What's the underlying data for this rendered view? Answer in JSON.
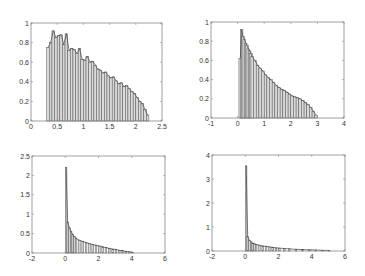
{
  "chart_data": [
    {
      "id": "top-left",
      "type": "bar",
      "title": "",
      "xlabel": "",
      "ylabel": "",
      "xlim": [
        0,
        2.5
      ],
      "ylim": [
        0,
        1
      ],
      "xticks": [
        0,
        0.5,
        1,
        1.5,
        2,
        2.5
      ],
      "xtick_labels": [
        "0",
        "0.5",
        "1",
        "1.5",
        "2",
        "2.5"
      ],
      "yticks": [
        0,
        0.2,
        0.4,
        0.6,
        0.8,
        1
      ],
      "ytick_labels": [
        "0",
        "0.2",
        "0.4",
        "0.6",
        "0.8",
        "1"
      ],
      "grid": false,
      "box": {
        "x0": 31,
        "y0": 23,
        "x1": 162,
        "y1": 121
      },
      "bins_x": [
        0.3,
        0.35,
        0.4,
        0.45,
        0.5,
        0.55,
        0.6,
        0.65,
        0.7,
        0.75,
        0.8,
        0.85,
        0.9,
        0.95,
        1.0,
        1.05,
        1.1,
        1.15,
        1.2,
        1.25,
        1.3,
        1.35,
        1.4,
        1.45,
        1.5,
        1.55,
        1.6,
        1.65,
        1.7,
        1.75,
        1.8,
        1.85,
        1.9,
        1.95,
        2.0,
        2.05,
        2.1,
        2.15,
        2.2
      ],
      "values": [
        0.75,
        0.8,
        0.92,
        0.85,
        0.87,
        0.88,
        0.78,
        0.89,
        0.72,
        0.74,
        0.73,
        0.69,
        0.74,
        0.63,
        0.62,
        0.66,
        0.6,
        0.61,
        0.57,
        0.53,
        0.52,
        0.49,
        0.5,
        0.46,
        0.44,
        0.45,
        0.41,
        0.38,
        0.39,
        0.35,
        0.36,
        0.33,
        0.3,
        0.28,
        0.24,
        0.2,
        0.18,
        0.12,
        0.06
      ],
      "bin_width": 0.05,
      "curve": "density"
    },
    {
      "id": "top-right",
      "type": "bar",
      "title": "",
      "xlabel": "",
      "ylabel": "",
      "xlim": [
        -1,
        4
      ],
      "ylim": [
        0,
        1
      ],
      "xticks": [
        -1,
        0,
        1,
        2,
        3,
        4
      ],
      "xtick_labels": [
        "-1",
        "0",
        "1",
        "2",
        "3",
        "4"
      ],
      "yticks": [
        0,
        0.2,
        0.4,
        0.6,
        0.8,
        1
      ],
      "ytick_labels": [
        "0",
        "0.2",
        "0.4",
        "0.6",
        "0.8",
        "1"
      ],
      "grid": false,
      "box": {
        "x0": 211,
        "y0": 22,
        "x1": 344,
        "y1": 118
      },
      "bins_x": [
        0.05,
        0.1,
        0.15,
        0.2,
        0.25,
        0.3,
        0.35,
        0.4,
        0.45,
        0.5,
        0.6,
        0.7,
        0.8,
        0.9,
        1.0,
        1.1,
        1.2,
        1.3,
        1.4,
        1.5,
        1.6,
        1.7,
        1.8,
        1.9,
        2.0,
        2.1,
        2.2,
        2.3,
        2.4,
        2.5,
        2.6,
        2.7,
        2.8,
        2.9
      ],
      "values": [
        0.62,
        0.92,
        0.85,
        0.82,
        0.78,
        0.76,
        0.72,
        0.7,
        0.67,
        0.64,
        0.6,
        0.55,
        0.52,
        0.49,
        0.45,
        0.42,
        0.4,
        0.37,
        0.34,
        0.32,
        0.3,
        0.29,
        0.27,
        0.25,
        0.23,
        0.22,
        0.21,
        0.2,
        0.18,
        0.16,
        0.14,
        0.11,
        0.07,
        0.03
      ],
      "bin_width": 0.1,
      "curve": "density"
    },
    {
      "id": "bottom-left",
      "type": "bar",
      "title": "",
      "xlabel": "",
      "ylabel": "",
      "xlim": [
        -2,
        6
      ],
      "ylim": [
        0,
        2.5
      ],
      "xticks": [
        -2,
        0,
        2,
        4,
        6
      ],
      "xtick_labels": [
        "-2",
        "0",
        "2",
        "4",
        "6"
      ],
      "yticks": [
        0,
        0.5,
        1,
        1.5,
        2,
        2.5
      ],
      "ytick_labels": [
        "0",
        "0.5",
        "1",
        "1.5",
        "2",
        "2.5"
      ],
      "grid": false,
      "box": {
        "x0": 32,
        "y0": 156,
        "x1": 165,
        "y1": 253
      },
      "bins_x": [
        0.0,
        0.1,
        0.2,
        0.3,
        0.4,
        0.5,
        0.6,
        0.8,
        1.0,
        1.2,
        1.4,
        1.6,
        1.8,
        2.0,
        2.2,
        2.4,
        2.6,
        2.8,
        3.0,
        3.2,
        3.4,
        3.6,
        3.8,
        4.0
      ],
      "values": [
        2.2,
        0.8,
        0.65,
        0.55,
        0.48,
        0.42,
        0.38,
        0.33,
        0.3,
        0.27,
        0.24,
        0.22,
        0.2,
        0.18,
        0.16,
        0.14,
        0.12,
        0.1,
        0.09,
        0.07,
        0.06,
        0.04,
        0.03,
        0.02
      ],
      "bin_width": 0.1,
      "curve": "density"
    },
    {
      "id": "bottom-right",
      "type": "bar",
      "title": "",
      "xlabel": "",
      "ylabel": "",
      "xlim": [
        -2,
        6
      ],
      "ylim": [
        0,
        4
      ],
      "xticks": [
        -2,
        0,
        2,
        4,
        6
      ],
      "xtick_labels": [
        "-2",
        "0",
        "2",
        "4",
        "6"
      ],
      "yticks": [
        0,
        1,
        2,
        3,
        4
      ],
      "ytick_labels": [
        "0",
        "1",
        "2",
        "3",
        "4"
      ],
      "grid": false,
      "box": {
        "x0": 212,
        "y0": 155,
        "x1": 345,
        "y1": 251
      },
      "bins_x": [
        0.0,
        0.1,
        0.2,
        0.3,
        0.4,
        0.5,
        0.6,
        0.8,
        1.0,
        1.2,
        1.4,
        1.6,
        1.8,
        2.0,
        2.3,
        2.6,
        3.0,
        3.4,
        3.8,
        4.2,
        4.6,
        5.0
      ],
      "values": [
        3.55,
        0.6,
        0.45,
        0.38,
        0.33,
        0.3,
        0.27,
        0.24,
        0.21,
        0.19,
        0.17,
        0.15,
        0.13,
        0.12,
        0.1,
        0.09,
        0.07,
        0.06,
        0.05,
        0.04,
        0.03,
        0.02
      ],
      "bin_width": 0.1,
      "curve": "density"
    }
  ]
}
